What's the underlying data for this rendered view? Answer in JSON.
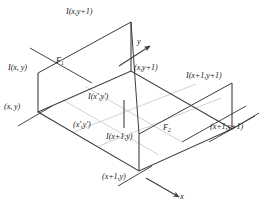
{
  "figure": {
    "colors": {
      "stroke_dark": "#3b3b3b",
      "stroke_light": "#b9b9b9",
      "text": "#1a1a1a",
      "background": "#ffffff"
    },
    "axes": [
      {
        "name": "y-axis",
        "label": "y"
      },
      {
        "name": "x-axis",
        "label": "x"
      }
    ],
    "labels": {
      "intensity_x_y1": "I(x,y+1)",
      "intensity_x_y": "I(x, y)",
      "intensity_x1_y1": "I(x+1,y+1)",
      "intensity_x1_y": "I(x+1,y)",
      "intensity_xp_yp": "I(x',y')",
      "point_x_y": "(x, y)",
      "point_x_y1": "(x,y+1)",
      "point_x1_y1": "(x+1,y+1)",
      "point_x1_y": "(x+1,y)",
      "point_xp_yp": "(x',y')",
      "f1": "F",
      "f1_sub": "1",
      "f2": "F",
      "f2_sub": "2",
      "axis_y": "y",
      "axis_x": "x"
    }
  }
}
